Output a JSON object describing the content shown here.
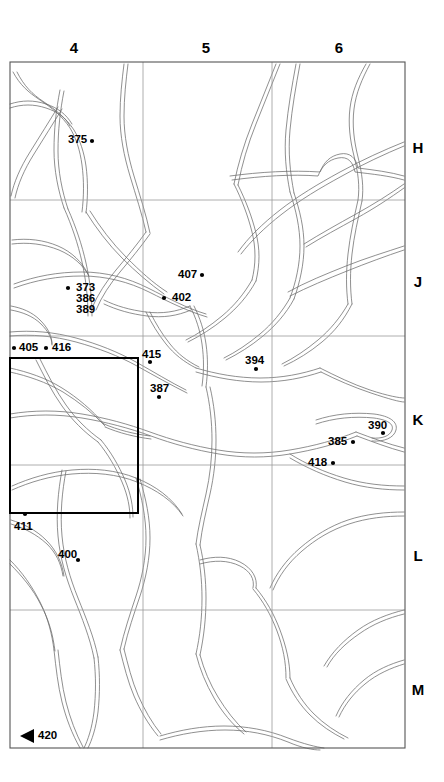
{
  "figure": {
    "type": "grid-reference-map",
    "background_color": "#ffffff",
    "line_color": "#000000",
    "road_color": "#5a5a5a",
    "grid_color": "#9a9a9a",
    "frame_color": "#555555",
    "highlight_box_color": "#000000"
  },
  "grid": {
    "column_labels": [
      "4",
      "5",
      "6"
    ],
    "row_labels": [
      "H",
      "J",
      "K",
      "L",
      "M"
    ],
    "frame": {
      "left": 10,
      "top": 62,
      "right": 405,
      "bottom": 748
    },
    "vertical_gridlines_x": [
      143,
      272
    ],
    "horizontal_gridlines_y": [
      200,
      336,
      465,
      610
    ],
    "column_label_positions_x": [
      74,
      206,
      339
    ],
    "column_label_y": 47,
    "row_label_x": 412,
    "row_label_positions_y": [
      140,
      274,
      412,
      548,
      682
    ]
  },
  "highlight_box": {
    "name": "detail-area-rectangle",
    "x": 10,
    "y": 358,
    "width": 128,
    "height": 155
  },
  "sites": [
    {
      "id": "375",
      "label": "375",
      "text_x": 68,
      "text_y": 133,
      "dot_x": 92,
      "dot_y": 141,
      "dot_side": "right"
    },
    {
      "id": "373",
      "label": "373",
      "text_x": 76,
      "text_y": 281,
      "dot_x": 68,
      "dot_y": 288,
      "dot_side": "left"
    },
    {
      "id": "386",
      "label": "386",
      "text_x": 76,
      "text_y": 291,
      "dot_x": null,
      "dot_y": null,
      "dot_side": "none"
    },
    {
      "id": "389",
      "label": "389",
      "text_x": 76,
      "text_y": 302,
      "dot_x": null,
      "dot_y": null,
      "dot_side": "none"
    },
    {
      "id": "407",
      "label": "407",
      "text_x": 178,
      "text_y": 268,
      "dot_x": 202,
      "dot_y": 275,
      "dot_side": "right"
    },
    {
      "id": "402",
      "label": "402",
      "text_x": 172,
      "text_y": 291,
      "dot_x": 164,
      "dot_y": 298,
      "dot_side": "left"
    },
    {
      "id": "405",
      "label": "405",
      "text_x": 19,
      "text_y": 343,
      "dot_x": 14,
      "dot_y": 349,
      "dot_side": "left"
    },
    {
      "id": "416",
      "label": "416",
      "text_x": 54,
      "text_y": 343,
      "dot_x": 46,
      "dot_y": 349,
      "dot_side": "left"
    },
    {
      "id": "415",
      "label": "415",
      "text_x": 142,
      "text_y": 349,
      "dot_x": 150,
      "dot_y": 362,
      "dot_side": "below"
    },
    {
      "id": "394",
      "label": "394",
      "text_x": 246,
      "text_y": 355,
      "dot_x": 256,
      "dot_y": 369,
      "dot_side": "below"
    },
    {
      "id": "387",
      "label": "387",
      "text_x": 150,
      "text_y": 383,
      "dot_x": 159,
      "dot_y": 397,
      "dot_side": "below"
    },
    {
      "id": "390",
      "label": "390",
      "text_x": 368,
      "text_y": 420,
      "dot_x": 383,
      "dot_y": 433,
      "dot_side": "below"
    },
    {
      "id": "385",
      "label": "385",
      "text_x": 329,
      "text_y": 436,
      "dot_x": 353,
      "dot_y": 442,
      "dot_side": "right"
    },
    {
      "id": "418",
      "label": "418",
      "text_x": 309,
      "text_y": 456,
      "dot_x": 333,
      "dot_y": 463,
      "dot_side": "right"
    },
    {
      "id": "411",
      "label": "411",
      "text_x": 14,
      "text_y": 524,
      "dot_x": 25,
      "dot_y": 514,
      "dot_side": "above"
    },
    {
      "id": "400",
      "label": "400",
      "text_x": 58,
      "text_y": 549,
      "dot_x": 78,
      "dot_y": 560,
      "dot_side": "below"
    },
    {
      "id": "420",
      "label": "420",
      "text_x": 36,
      "text_y": 736,
      "dot_x": null,
      "dot_y": null,
      "dot_side": "arrow"
    }
  ],
  "arrow_marker": {
    "name": "direction-arrow-420",
    "x": 22,
    "y": 735,
    "direction": "left",
    "color": "#000000"
  }
}
